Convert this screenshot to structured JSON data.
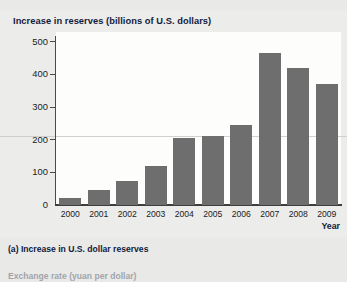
{
  "figure": {
    "panel_title": "Increase in reserves (billions of U.S. dollars)",
    "caption_a": "(a) Increase in U.S. dollar reserves",
    "caption_next_partial": "Exchange rate (yuan per dollar)",
    "bar_color": "#6e6e6e",
    "title_color": "#12203c",
    "panel_background": "#ececeb",
    "plot_background": "#fdfdfc"
  },
  "chart_data": {
    "type": "bar",
    "title": "Increase in reserves (billions of U.S. dollars)",
    "xlabel": "Year",
    "ylabel": "Increase in reserves (billions of U.S. dollars)",
    "categories": [
      "2000",
      "2001",
      "2002",
      "2003",
      "2004",
      "2005",
      "2006",
      "2007",
      "2008",
      "2009"
    ],
    "values": [
      20,
      45,
      75,
      118,
      205,
      210,
      245,
      465,
      420,
      370
    ],
    "ylim": [
      0,
      530
    ],
    "yticks": [
      0,
      100,
      200,
      300,
      400,
      500
    ],
    "ytick_labels": [
      "0",
      "100",
      "200",
      "300",
      "400",
      "500"
    ],
    "grid": false,
    "legend": null,
    "series": [
      {
        "name": "Increase in U.S. dollar reserves",
        "values": [
          20,
          45,
          75,
          118,
          205,
          210,
          245,
          465,
          420,
          370
        ]
      }
    ]
  }
}
